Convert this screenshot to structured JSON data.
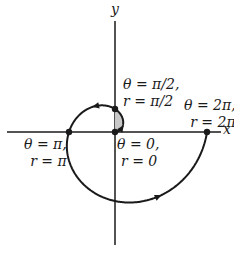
{
  "diagram": {
    "axes": {
      "x_label": "x",
      "y_label": "y"
    },
    "points": [
      {
        "id": "origin",
        "line1": "θ = 0,",
        "line2": "r = 0"
      },
      {
        "id": "half-pi",
        "line1": "θ = π/2,",
        "line2": "r = π/2"
      },
      {
        "id": "pi",
        "line1": "θ = π,",
        "line2": "r = π"
      },
      {
        "id": "two-pi",
        "line1": "θ = 2π,",
        "line2": "r = 2π"
      }
    ],
    "colors": {
      "curve": "#1a1a1a",
      "shade": "#c8c8c8"
    }
  }
}
